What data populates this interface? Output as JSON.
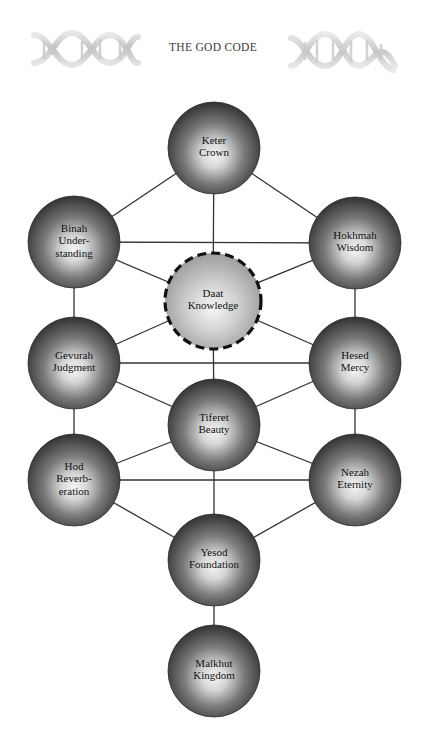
{
  "header": {
    "title": "THE GOD CODE",
    "left_graphic": "dna-helix-icon",
    "right_graphic": "dna-helix-icon"
  },
  "colors": {
    "background": "#ffffff",
    "line": "#333333",
    "sphere_edge": "#353535",
    "sphere_center": "#f2f2f2",
    "daat_edge": "#a8a8a8",
    "daat_center": "#f4f4f4",
    "daat_border": "#111111",
    "text": "#111111"
  },
  "diagram": {
    "type": "tree-of-life",
    "nodes": [
      {
        "id": "keter",
        "lines": [
          "Keter",
          "Crown"
        ],
        "x": 214,
        "y": 148,
        "style": "solid"
      },
      {
        "id": "binah",
        "lines": [
          "Binah",
          "Under-",
          "standing"
        ],
        "x": 74,
        "y": 242,
        "style": "solid"
      },
      {
        "id": "hokhmah",
        "lines": [
          "Hokhmah",
          "Wisdom"
        ],
        "x": 355,
        "y": 243,
        "style": "solid"
      },
      {
        "id": "daat",
        "lines": [
          "Daat",
          "Knowledge"
        ],
        "x": 213,
        "y": 301,
        "style": "dashed"
      },
      {
        "id": "gevurah",
        "lines": [
          "Gevurah",
          "Judgment"
        ],
        "x": 74,
        "y": 363,
        "style": "solid"
      },
      {
        "id": "hesed",
        "lines": [
          "Hesed",
          "Mercy"
        ],
        "x": 355,
        "y": 363,
        "style": "solid"
      },
      {
        "id": "tiferet",
        "lines": [
          "Tiferet",
          "Beauty"
        ],
        "x": 214,
        "y": 425,
        "style": "solid"
      },
      {
        "id": "hod",
        "lines": [
          "Hod",
          "Reverb-",
          "eration"
        ],
        "x": 74,
        "y": 480,
        "style": "solid"
      },
      {
        "id": "nezah",
        "lines": [
          "Nezah",
          "Eternity"
        ],
        "x": 355,
        "y": 480,
        "style": "solid"
      },
      {
        "id": "yesod",
        "lines": [
          "Yesod",
          "Foundation"
        ],
        "x": 214,
        "y": 560,
        "style": "solid"
      },
      {
        "id": "malkhut",
        "lines": [
          "Malkhut",
          "Kingdom"
        ],
        "x": 214,
        "y": 671,
        "style": "solid"
      }
    ],
    "edges": [
      [
        "keter",
        "binah"
      ],
      [
        "keter",
        "hokhmah"
      ],
      [
        "keter",
        "daat"
      ],
      [
        "binah",
        "hokhmah"
      ],
      [
        "binah",
        "daat"
      ],
      [
        "hokhmah",
        "daat"
      ],
      [
        "binah",
        "gevurah"
      ],
      [
        "hokhmah",
        "hesed"
      ],
      [
        "gevurah",
        "daat"
      ],
      [
        "hesed",
        "daat"
      ],
      [
        "daat",
        "tiferet"
      ],
      [
        "gevurah",
        "hesed"
      ],
      [
        "gevurah",
        "tiferet"
      ],
      [
        "hesed",
        "tiferet"
      ],
      [
        "gevurah",
        "hod"
      ],
      [
        "hesed",
        "nezah"
      ],
      [
        "tiferet",
        "hod"
      ],
      [
        "tiferet",
        "nezah"
      ],
      [
        "hod",
        "nezah"
      ],
      [
        "tiferet",
        "yesod"
      ],
      [
        "hod",
        "yesod"
      ],
      [
        "nezah",
        "yesod"
      ],
      [
        "yesod",
        "malkhut"
      ]
    ]
  }
}
